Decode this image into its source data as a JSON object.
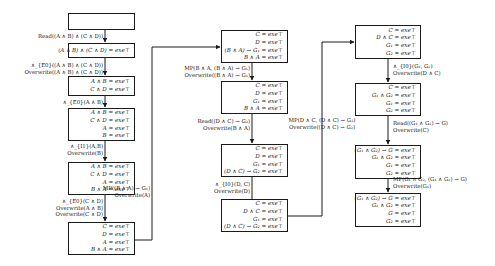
{
  "columns": [
    {
      "boxes": [
        {
          "lines": []
        },
        {
          "lines": [
            "(A ∧ B) ∧ (C ∧ D) = 𝑒𝑥𝑒⊤"
          ]
        },
        {
          "lines": [
            "A ∧ B = exe⊤",
            "C ∧ D = exe⊤"
          ]
        },
        {
          "lines": [
            "A ∧ B = exe⊤",
            "C ∧ D = exe⊤",
            "A = exe⊤",
            "B = exe⊤"
          ]
        },
        {
          "lines": [
            "A ∧ B = exe⊤",
            "C ∧ D = exe⊤",
            "A = exe⊤",
            "B ∧ A = exe⊤"
          ]
        },
        {
          "lines": [
            "C = exe⊤",
            "D = exe⊤",
            "A = exe⊤",
            "B ∧ A = exe⊤"
          ]
        }
      ],
      "edges": [
        {
          "lines": [
            "Read((A ∧ B) ∧ (C ∧ D))"
          ]
        },
        {
          "lines": [
            "∧_{E0}((A ∧ B) ∧ (C ∧ D))",
            "Overwrite((A ∧ B) ∧ (C ∧ D))"
          ]
        },
        {
          "lines": [
            "∧_{E0}(A ∧ B)"
          ]
        },
        {
          "lines": [
            "∧_{I1}(A,B)",
            "Overwrite(B)"
          ]
        },
        {
          "lines": [
            "∧_{E0}(C ∧ D)",
            "Overwrite(A ∧ B)",
            "Overwrite(C ∧ D)"
          ]
        }
      ]
    },
    {
      "boxes": [
        {
          "lines": [
            "C = exe⊤",
            "D = exe⊤",
            "(B ∧ A) → G₁ = exe⊤",
            "B ∧ A = exe⊤"
          ]
        },
        {
          "lines": [
            "C = exe⊤",
            "D = exe⊤",
            "G₁ = exe⊤",
            "B ∧ A = exe⊤"
          ]
        },
        {
          "lines": [
            "C = exe⊤",
            "D = exe⊤",
            "G₁ = exe⊤",
            "(D ∧ C) → G₂ = exe⊤"
          ]
        },
        {
          "lines": [
            "C = exe⊤",
            "D ∧ C = exe⊤",
            "G₁ = exe⊤",
            "(D ∧ C) → G₂ = exe⊤"
          ]
        }
      ],
      "edges": [
        {
          "lines": [
            "MP(B ∧ A, (B ∧ A) → G₁)",
            "Overwrite((B ∧ A) → G₁)"
          ]
        },
        {
          "lines": [
            "Read((D ∧ C) → G₂)",
            "Overwrite(B ∧ A)"
          ]
        },
        {
          "lines": [
            "∧_{I0}(D, C)",
            "Overwrite(D)"
          ]
        }
      ]
    },
    {
      "boxes": [
        {
          "lines": [
            "C = exe⊤",
            "D ∧ C = exe⊤",
            "G₁ = exe⊤",
            "G₂ = exe⊤"
          ]
        },
        {
          "lines": [
            "C = exe⊤",
            "G₁ ∧ G₂ = exe⊤",
            "G₁ = exe⊤",
            "G₂ = exe⊤"
          ]
        },
        {
          "lines": [
            "(G₁ ∧ G₂) → G = exe⊤",
            "G₁ ∧ G₂ = exe⊤",
            "G₁ = exe⊤",
            "G₂ = exe⊤"
          ]
        },
        {
          "lines": [
            "(G₁ ∧ G₂) → G = exe⊤",
            "G₁ ∧ G₂ = exe⊤",
            "G = exe⊤",
            "G₂ = exe⊤"
          ]
        }
      ],
      "edges": [
        {
          "lines": [
            "∧_{I0}(G₁, G₂)",
            "Overwrite(D ∧ C)"
          ]
        },
        {
          "lines": [
            "Read((G₁ ∧ G₂) → G)",
            "Overwrite(C)"
          ]
        },
        {
          "lines": [
            "MP(G₁ ∧ G₂, (G₁ ∧ G₂) → G)",
            "Overwrite(G₁)"
          ]
        }
      ]
    }
  ],
  "cross_edges": [
    {
      "from": "col1.box5",
      "to": "col2.box0",
      "lines": [
        "MP((B ∧ A) → G₁)",
        "Overwrite(A)"
      ]
    },
    {
      "from": "col2.box3",
      "to": "col3.box0",
      "lines": [
        "MP(D ∧ C, (D ∧ C) → G₂)",
        "Overwrite((D ∧ C) → G₂)"
      ]
    }
  ]
}
